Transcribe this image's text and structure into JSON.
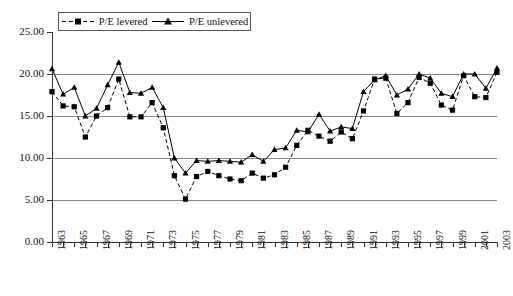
{
  "chart_data": {
    "type": "line",
    "title": "",
    "subtitle": "",
    "xlabel": "",
    "ylabel": "",
    "ylim": [
      0.0,
      25.0
    ],
    "xlim": [
      1963,
      2003
    ],
    "grid": "horizontal",
    "legend_position": "top-left-inside",
    "y_ticks": [
      "0.00",
      "5.00",
      "10.00",
      "15.00",
      "20.00",
      "25.00"
    ],
    "y_tick_values": [
      0.0,
      5.0,
      10.0,
      15.0,
      20.0,
      25.0
    ],
    "x": [
      1963,
      1964,
      1965,
      1966,
      1967,
      1968,
      1969,
      1970,
      1971,
      1972,
      1973,
      1974,
      1975,
      1976,
      1977,
      1978,
      1979,
      1980,
      1981,
      1982,
      1983,
      1984,
      1985,
      1986,
      1987,
      1988,
      1989,
      1990,
      1991,
      1992,
      1993,
      1994,
      1995,
      1996,
      1997,
      1998,
      1999,
      2000,
      2001,
      2002,
      2003
    ],
    "x_tick_labels": [
      "1963",
      "",
      "1965",
      "",
      "1967",
      "",
      "1969",
      "",
      "1971",
      "",
      "1973",
      "",
      "1975",
      "",
      "1977",
      "",
      "1979",
      "",
      "1981",
      "",
      "1983",
      "",
      "1985",
      "",
      "1987",
      "",
      "1989",
      "",
      "1991",
      "",
      "1993",
      "",
      "1995",
      "",
      "1997",
      "",
      "1999",
      "",
      "2001",
      "",
      "2003"
    ],
    "x_tick_labels_shown": [
      "1963",
      "1965",
      "1967",
      "1969",
      "1971",
      "1973",
      "1975",
      "1977",
      "1979",
      "1981",
      "1983",
      "1985",
      "1987",
      "1989",
      "1991",
      "1993",
      "1995",
      "1997",
      "1999",
      "2001",
      "2003"
    ],
    "series": [
      {
        "name": "P/E levered",
        "line_style": "dashed",
        "marker": "square",
        "color": "#000000",
        "values": [
          17.9,
          16.2,
          16.1,
          12.5,
          15.0,
          16.0,
          19.4,
          14.9,
          14.9,
          16.6,
          13.6,
          7.9,
          5.1,
          7.8,
          8.4,
          7.9,
          7.5,
          7.3,
          8.2,
          7.6,
          8.0,
          8.9,
          11.5,
          13.3,
          12.6,
          12.0,
          13.1,
          12.3,
          15.6,
          19.4,
          19.5,
          15.3,
          16.6,
          19.6,
          18.9,
          16.3,
          15.7,
          19.8,
          17.3,
          17.2,
          20.2
        ]
      },
      {
        "name": "P/E unlevered",
        "line_style": "solid",
        "marker": "triangle",
        "color": "#000000",
        "values": [
          20.6,
          17.6,
          18.4,
          15.0,
          15.9,
          18.7,
          21.4,
          17.8,
          17.7,
          18.4,
          16.0,
          10.0,
          8.2,
          9.7,
          9.6,
          9.7,
          9.6,
          9.5,
          10.4,
          9.6,
          11.0,
          11.2,
          13.3,
          13.1,
          15.2,
          13.2,
          13.7,
          13.5,
          17.9,
          19.3,
          19.8,
          17.5,
          18.2,
          20.0,
          19.5,
          17.7,
          17.3,
          20.0,
          20.0,
          18.3,
          20.7
        ]
      }
    ]
  },
  "legend": {
    "items": [
      {
        "label": "P/E levered",
        "style": "dashed-square"
      },
      {
        "label": "P/E unlevered",
        "style": "solid-triangle"
      }
    ]
  },
  "axes": {
    "y_title": "",
    "x_title": ""
  }
}
